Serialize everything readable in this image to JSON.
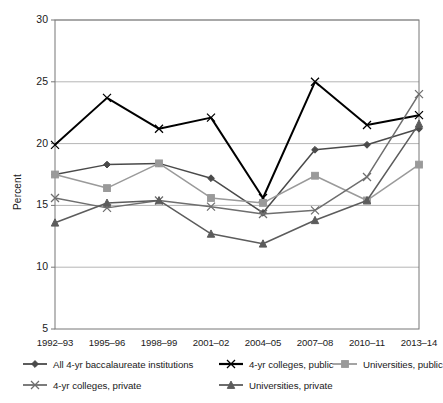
{
  "chart_data": {
    "type": "line",
    "title": "",
    "xlabel": "",
    "ylabel": "Percent",
    "ylim": [
      5,
      30
    ],
    "yticks": [
      5,
      10,
      15,
      20,
      25,
      30
    ],
    "grid": "horizontal",
    "legend_position": "bottom",
    "categories": [
      "1992–93",
      "1995–96",
      "1998–99",
      "2001–02",
      "2004–05",
      "2007–08",
      "2010–11",
      "2013–14"
    ],
    "series": [
      {
        "name": "All 4-yr baccalaureate institutions",
        "marker": "diamond",
        "color": "#4a4a4a",
        "values": [
          17.5,
          18.3,
          18.4,
          17.2,
          14.4,
          19.5,
          19.9,
          21.2
        ]
      },
      {
        "name": "4-yr colleges, public",
        "marker": "x",
        "color": "#000000",
        "values": [
          19.9,
          23.7,
          21.2,
          22.1,
          15.6,
          25.0,
          21.5,
          22.3
        ]
      },
      {
        "name": "Universities, public",
        "marker": "square",
        "color": "#9a9a9a",
        "values": [
          17.5,
          16.4,
          18.4,
          15.6,
          15.2,
          17.4,
          15.4,
          18.3
        ]
      },
      {
        "name": "4-yr colleges, private",
        "marker": "x",
        "color": "#6e6e6e",
        "values": [
          15.6,
          14.8,
          15.4,
          14.9,
          14.3,
          14.6,
          17.3,
          24.0
        ]
      },
      {
        "name": "Universities, private",
        "marker": "triangle",
        "color": "#5c5c5c",
        "values": [
          13.6,
          15.2,
          15.4,
          12.7,
          11.9,
          13.8,
          15.4,
          21.6
        ]
      }
    ]
  },
  "legend": {
    "rows": [
      [
        {
          "label": "All 4-yr baccalaureate institutions",
          "series": 0
        },
        {
          "label": "4-yr colleges, public",
          "series": 1
        },
        {
          "label": "Universities, public",
          "series": 2
        }
      ],
      [
        {
          "label": "4-yr colleges, private",
          "series": 3
        },
        {
          "label": "Universities, private",
          "series": 4
        }
      ]
    ]
  }
}
